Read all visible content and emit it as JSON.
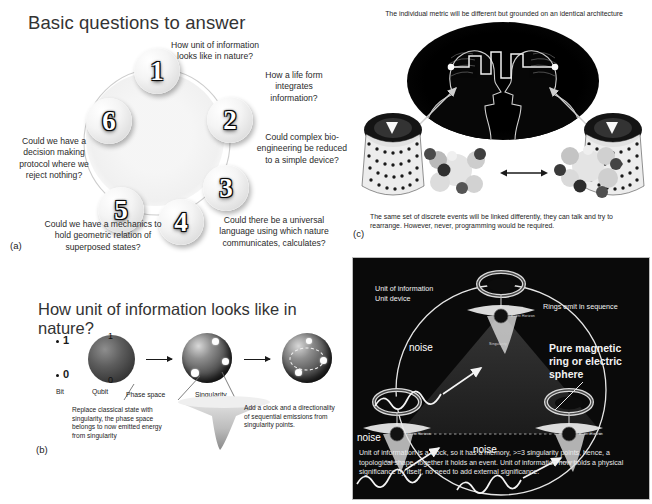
{
  "figure": {
    "panels": [
      "a",
      "b",
      "c",
      "d"
    ],
    "background_color": "#ffffff",
    "dark_panel_color": "#0a0a0a"
  },
  "panel_a": {
    "letter": "(a)",
    "title": "Basic questions to answer",
    "nodes": [
      {
        "number": "1"
      },
      {
        "number": "2"
      },
      {
        "number": "3"
      },
      {
        "number": "4"
      },
      {
        "number": "5"
      },
      {
        "number": "6"
      }
    ],
    "questions": [
      {
        "id": "q1",
        "text": "How unit of information looks like in nature?"
      },
      {
        "id": "q2",
        "text": "How a life form integrates information?"
      },
      {
        "id": "q3",
        "text": "Could complex bio-engineering be reduced to a simple device?"
      },
      {
        "id": "q4",
        "text": "Could there be a universal language using which nature communicates, calculates?"
      },
      {
        "id": "q5",
        "text": "Could we have a mechanics to hold geometric relation of superposed states?"
      },
      {
        "id": "q6",
        "text": "Could we have a decision making protocol where we reject nothing?"
      }
    ]
  },
  "panel_b": {
    "letter": "(b)",
    "title": "How unit of information looks like in nature?",
    "bit_values": [
      "1",
      "0"
    ],
    "sphere_poles": [
      "1",
      "0"
    ],
    "labels": {
      "bit": "Bit",
      "qubit": "Qubit",
      "phase_space": "Phase space",
      "singularity": "Singularity"
    },
    "captions": [
      "Replace classical state with singularity, the phase space belongs to now emitted energy from singularity",
      "Add a clock and a directionality of sequential emissions from singularity points."
    ]
  },
  "panel_c": {
    "letter": "(c)",
    "top_caption": "The individual metric will be different but grounded on an identical architecture",
    "bottom_caption": "The same set of discrete events will be linked differently, they can talk and try to rearrange. However, never, programming would be required."
  },
  "panel_d": {
    "letter": "(d)",
    "labels": {
      "unit_of_information": "Unit of information",
      "unit_device": "Unit device",
      "rings_emit": "Rings emit in sequence",
      "pure_magnetic": "Pure magnetic ring or electric sphere",
      "noise_top": "noise",
      "noise_left": "noise",
      "noise_bottom": "noise",
      "event_horizon": "Event Horizon",
      "singularity": "Singularity"
    },
    "caption": "Unit of information is a clock, so it has a memory, >=3 singularity points, hence, a topological shape, together it holds an event. Unit of information now holds a physical significance by itself, no need to add external significance."
  }
}
